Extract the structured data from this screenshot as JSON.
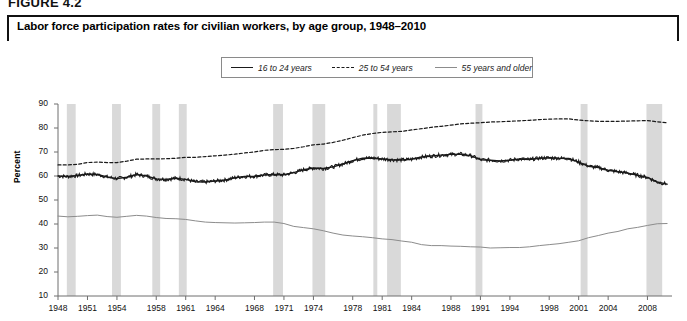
{
  "figure": {
    "number_label": "FIGURE 4.2",
    "title": "Labor force participation rates for civilian workers, by age group, 1948–2010"
  },
  "legend": {
    "position": "top-center",
    "items": [
      {
        "label": "16 to 24 years",
        "style": "solid-dark",
        "color": "#1a1a1a"
      },
      {
        "label": "25 to 54 years",
        "style": "dashed",
        "color": "#1a1a1a"
      },
      {
        "label": "55 years and older",
        "style": "solid-gray",
        "color": "#8c8c8c"
      }
    ]
  },
  "axes": {
    "ylabel": "Percent",
    "yticks": [
      "90",
      "80",
      "70",
      "60",
      "50",
      "40",
      "30",
      "20",
      "10"
    ],
    "xticks": [
      "1948",
      "1951",
      "1954",
      "1958",
      "1961",
      "1964",
      "1968",
      "1971",
      "1974",
      "1978",
      "1981",
      "1984",
      "1988",
      "1991",
      "1994",
      "1998",
      "2001",
      "2004",
      "2008"
    ]
  },
  "colors": {
    "recession_band": "#d9d9d9",
    "series_young": "#1a1a1a",
    "series_prime": "#1a1a1a",
    "series_older": "#8c8c8c",
    "axis": "#6e6e6e",
    "frame": "#111111"
  },
  "chart_data": {
    "type": "line",
    "title": "Labor force participation rates for civilian workers, by age group, 1948–2010",
    "xlabel": "",
    "ylabel": "Percent",
    "xlim": [
      1948,
      2010.5
    ],
    "ylim": [
      10,
      90
    ],
    "grid": false,
    "legend_position": "top-center",
    "xticks": [
      1948,
      1951,
      1954,
      1958,
      1961,
      1964,
      1968,
      1971,
      1974,
      1978,
      1981,
      1984,
      1988,
      1991,
      1994,
      1998,
      2001,
      2004,
      2008
    ],
    "yticks": [
      10,
      20,
      30,
      40,
      50,
      60,
      70,
      80,
      90
    ],
    "recession_bands": [
      {
        "start": 1948.9,
        "end": 1949.8
      },
      {
        "start": 1953.5,
        "end": 1954.4
      },
      {
        "start": 1957.6,
        "end": 1958.4
      },
      {
        "start": 1960.3,
        "end": 1961.1
      },
      {
        "start": 1969.9,
        "end": 1970.9
      },
      {
        "start": 1973.9,
        "end": 1975.2
      },
      {
        "start": 1980.1,
        "end": 1980.5
      },
      {
        "start": 1981.5,
        "end": 1982.9
      },
      {
        "start": 1990.5,
        "end": 1991.2
      },
      {
        "start": 2001.2,
        "end": 2001.9
      },
      {
        "start": 2007.9,
        "end": 2009.5
      }
    ],
    "series": [
      {
        "name": "16 to 24 years",
        "style": "solid",
        "color": "#1a1a1a",
        "x": [
          1948,
          1949,
          1950,
          1951,
          1952,
          1953,
          1954,
          1955,
          1956,
          1957,
          1958,
          1959,
          1960,
          1961,
          1962,
          1963,
          1964,
          1965,
          1966,
          1967,
          1968,
          1969,
          1970,
          1971,
          1972,
          1973,
          1974,
          1975,
          1976,
          1977,
          1978,
          1979,
          1980,
          1981,
          1982,
          1983,
          1984,
          1985,
          1986,
          1987,
          1988,
          1989,
          1990,
          1991,
          1992,
          1993,
          1994,
          1995,
          1996,
          1997,
          1998,
          1999,
          2000,
          2001,
          2002,
          2003,
          2004,
          2005,
          2006,
          2007,
          2008,
          2009,
          2010
        ],
        "values": [
          60.0,
          59.8,
          60.2,
          60.8,
          60.6,
          59.6,
          58.9,
          59.5,
          60.6,
          60.0,
          58.8,
          58.6,
          59.1,
          58.6,
          57.6,
          57.5,
          57.9,
          58.3,
          59.3,
          59.8,
          59.9,
          60.4,
          60.6,
          60.5,
          61.4,
          62.6,
          63.3,
          63.1,
          63.8,
          65.0,
          66.4,
          67.4,
          67.5,
          67.1,
          66.8,
          66.7,
          67.0,
          67.9,
          68.3,
          68.7,
          69.0,
          69.1,
          68.5,
          66.8,
          66.6,
          66.3,
          66.6,
          67.1,
          66.9,
          67.4,
          67.6,
          67.4,
          67.3,
          65.8,
          64.1,
          63.5,
          62.4,
          61.8,
          61.2,
          60.3,
          59.4,
          57.5,
          56.6
        ]
      },
      {
        "name": "25 to 54 years",
        "style": "dashed",
        "color": "#1a1a1a",
        "x": [
          1948,
          1949,
          1950,
          1951,
          1952,
          1953,
          1954,
          1955,
          1956,
          1957,
          1958,
          1959,
          1960,
          1961,
          1962,
          1963,
          1964,
          1965,
          1966,
          1967,
          1968,
          1969,
          1970,
          1971,
          1972,
          1973,
          1974,
          1975,
          1976,
          1977,
          1978,
          1979,
          1980,
          1981,
          1982,
          1983,
          1984,
          1985,
          1986,
          1987,
          1988,
          1989,
          1990,
          1991,
          1992,
          1993,
          1994,
          1995,
          1996,
          1997,
          1998,
          1999,
          2000,
          2001,
          2002,
          2003,
          2004,
          2005,
          2006,
          2007,
          2008,
          2009,
          2010
        ],
        "values": [
          64.6,
          64.6,
          64.9,
          65.6,
          65.8,
          65.6,
          65.6,
          66.2,
          67.0,
          67.1,
          67.1,
          67.2,
          67.4,
          67.8,
          67.8,
          68.1,
          68.4,
          68.7,
          69.1,
          69.6,
          70.0,
          70.7,
          71.0,
          71.1,
          71.5,
          72.2,
          73.0,
          73.3,
          74.0,
          74.9,
          76.0,
          77.0,
          77.7,
          78.2,
          78.4,
          78.6,
          79.2,
          79.7,
          80.3,
          80.7,
          81.2,
          81.7,
          82.0,
          82.2,
          82.5,
          82.6,
          82.8,
          83.0,
          83.2,
          83.5,
          83.7,
          83.8,
          83.8,
          83.3,
          83.0,
          82.8,
          82.8,
          82.8,
          82.9,
          83.0,
          83.1,
          82.6,
          82.2
        ]
      },
      {
        "name": "55 years and older",
        "style": "solid",
        "color": "#8c8c8c",
        "x": [
          1948,
          1949,
          1950,
          1951,
          1952,
          1953,
          1954,
          1955,
          1956,
          1957,
          1958,
          1959,
          1960,
          1961,
          1962,
          1963,
          1964,
          1965,
          1966,
          1967,
          1968,
          1969,
          1970,
          1971,
          1972,
          1973,
          1974,
          1975,
          1976,
          1977,
          1978,
          1979,
          1980,
          1981,
          1982,
          1983,
          1984,
          1985,
          1986,
          1987,
          1988,
          1989,
          1990,
          1991,
          1992,
          1993,
          1994,
          1995,
          1996,
          1997,
          1998,
          1999,
          2000,
          2001,
          2002,
          2003,
          2004,
          2005,
          2006,
          2007,
          2008,
          2009,
          2010
        ],
        "values": [
          43.3,
          43.0,
          43.2,
          43.5,
          43.7,
          43.1,
          42.8,
          43.2,
          43.6,
          43.3,
          42.7,
          42.3,
          42.2,
          41.9,
          41.3,
          40.8,
          40.6,
          40.5,
          40.4,
          40.5,
          40.6,
          40.8,
          40.8,
          40.2,
          39.0,
          38.5,
          38.0,
          37.2,
          36.2,
          35.4,
          35.0,
          34.7,
          34.3,
          33.8,
          33.5,
          32.9,
          32.4,
          31.4,
          31.0,
          31.0,
          30.8,
          30.7,
          30.5,
          30.4,
          30.0,
          30.1,
          30.2,
          30.2,
          30.5,
          31.0,
          31.4,
          31.8,
          32.4,
          33.0,
          34.3,
          35.2,
          36.2,
          36.9,
          38.0,
          38.6,
          39.4,
          40.1,
          40.2
        ]
      }
    ]
  }
}
